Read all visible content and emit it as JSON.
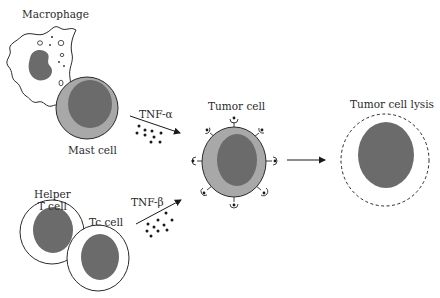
{
  "labels": {
    "macrophage": "Macrophage",
    "mast_cell": "Mast cell",
    "helper_t_cell_line1": "Helper",
    "helper_t_cell_line2": "T cell",
    "tc_cell": "Tc cell",
    "tnf_alpha": "TNF-α",
    "tnf_beta": "TNF-β",
    "tumor_cell": "Tumor cell",
    "tumor_cell_lysis": "Tumor cell lysis"
  },
  "colors": {
    "nucleus": "#6b6b6b",
    "cytoplasm": "#a8a8a8",
    "outline": "#2a2a2a",
    "background": "#ffffff"
  }
}
